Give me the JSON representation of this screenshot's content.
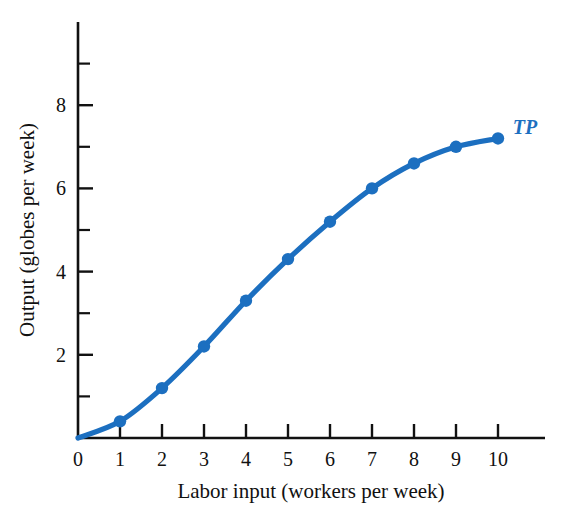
{
  "chart_data": {
    "type": "line",
    "title": "",
    "subtitle": "",
    "xlabel": "Labor input (workers per week)",
    "ylabel": "Output (globes per week)",
    "xlim": [
      0,
      10.6
    ],
    "ylim": [
      0,
      9.3
    ],
    "xticks": [
      "0",
      "1",
      "2",
      "3",
      "4",
      "5",
      "6",
      "7",
      "8",
      "9",
      "10"
    ],
    "yticks": [
      "2",
      "4",
      "6",
      "8"
    ],
    "y_minor_ticks": [
      1,
      3,
      5,
      7,
      9
    ],
    "grid": false,
    "legend_position": "inline-right-end",
    "series": [
      {
        "name": "TP",
        "label": "TP",
        "color": "#1c6fc0",
        "marker": "circle",
        "x": [
          0,
          1,
          2,
          3,
          4,
          5,
          6,
          7,
          8,
          9,
          10
        ],
        "values": [
          0,
          0.4,
          1.2,
          2.2,
          3.3,
          4.3,
          5.2,
          6.0,
          6.6,
          7.0,
          7.2
        ]
      }
    ],
    "annotations": [
      {
        "text": "TP",
        "x": 10.35,
        "y": 7.3,
        "color": "#1c6fc0",
        "style": "bold-italic"
      }
    ]
  },
  "colors": {
    "curve": "#1c6fc0",
    "marker": "#1c6fc0",
    "axis": "#111111",
    "text": "#111111",
    "background": "#ffffff"
  },
  "axes": {
    "x_axis_name": "Labor input (workers per week)",
    "y_axis_name": "Output (globes per week)"
  }
}
